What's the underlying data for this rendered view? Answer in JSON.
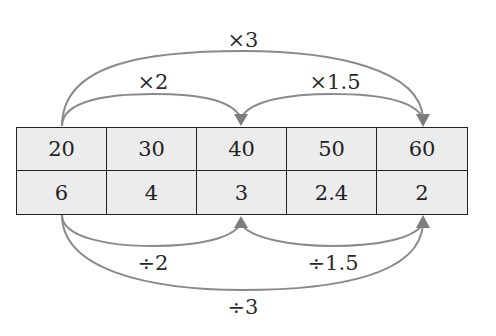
{
  "table": {
    "top_row": [
      "20",
      "30",
      "40",
      "50",
      "60"
    ],
    "bottom_row": [
      "6",
      "4",
      "3",
      "2.4",
      "2"
    ]
  },
  "top_arrows": [
    {
      "label": "×2",
      "from_col": 0,
      "to_col": 2
    },
    {
      "label": "×1.5",
      "from_col": 2,
      "to_col": 4
    },
    {
      "label": "×3",
      "from_col": 0,
      "to_col": 4
    }
  ],
  "bottom_arrows": [
    {
      "label": "÷2",
      "from_col": 0,
      "to_col": 2
    },
    {
      "label": "÷1.5",
      "from_col": 2,
      "to_col": 4
    },
    {
      "label": "÷3",
      "from_col": 0,
      "to_col": 4
    }
  ],
  "colors": {
    "cell_background": "#ececec",
    "border": "#222222",
    "arrow": "#8a8a8a",
    "text": "#222222"
  }
}
